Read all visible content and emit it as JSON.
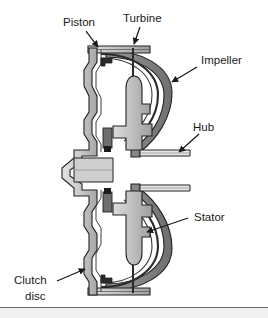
{
  "figure": {
    "background_color": "#ffffff",
    "line_color": "#2b2b2b",
    "shell_fill": "#8c8c8c",
    "metal_light": "#d6d6d6",
    "metal_mid": "#b5b5b5",
    "metal_dark": "#9a9a9a",
    "footer_rule_color": "#6b6b6b",
    "footer_band_color": "#f0f0f0"
  },
  "labels": {
    "piston": "Piston",
    "turbine": "Turbine",
    "impeller": "Impeller",
    "hub": "Hub",
    "stator": "Stator",
    "clutch_line1": "Clutch",
    "clutch_line2": "disc"
  },
  "callouts": [
    {
      "name": "piston",
      "text": "Piston",
      "label_x": 63,
      "label_y": 26,
      "arrow_from": [
        86,
        31
      ],
      "arrow_to": [
        98,
        48
      ]
    },
    {
      "name": "turbine",
      "text": "Turbine",
      "label_x": 127,
      "label_y": 22,
      "arrow_from": [
        140,
        27
      ],
      "arrow_to": [
        133,
        48
      ]
    },
    {
      "name": "impeller",
      "text": "Impeller",
      "label_x": 199,
      "label_y": 62,
      "arrow_from": [
        196,
        68
      ],
      "arrow_to": [
        171,
        82
      ]
    },
    {
      "name": "hub",
      "text": "Hub",
      "label_x": 189,
      "label_y": 130,
      "arrow_from": [
        198,
        136
      ],
      "arrow_to": [
        177,
        153
      ]
    },
    {
      "name": "stator",
      "text": "Stator",
      "label_x": 192,
      "label_y": 216,
      "arrow_from": [
        188,
        219
      ],
      "arrow_to": [
        146,
        232
      ]
    },
    {
      "name": "clutch",
      "text": "Clutch",
      "label_x": 14,
      "label_y": 283,
      "arrow_from": [
        58,
        280
      ],
      "arrow_to": [
        84,
        268
      ]
    }
  ]
}
